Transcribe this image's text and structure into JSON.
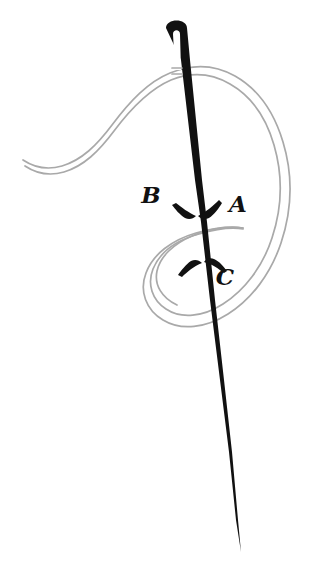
{
  "figure": {
    "background_color": "#ffffff",
    "width": 321,
    "height": 566
  },
  "objects": {
    "needle": {
      "name": "sewing-needle",
      "color": "#111111",
      "eye_color": "#ffffff",
      "description": "Long tapered black needle angled slightly right, with an elongated slot eye near the top and a sharp point at the bottom."
    },
    "thread": {
      "name": "thread",
      "color": "#a9a9a9",
      "stroke_width": 1.6,
      "description": "Light gray double-outline thread entering from the left, passing through the needle eye, curving right and coiling into a spiral loop below the needle entry point."
    }
  },
  "labels": [
    {
      "id": "A",
      "text": "A",
      "x": 238,
      "y": 212,
      "meaning": "point where needle goes down through the fabric"
    },
    {
      "id": "B",
      "text": "B",
      "x": 151,
      "y": 203,
      "meaning": "label for the downward motion of the needle"
    },
    {
      "id": "C",
      "text": "C",
      "x": 225,
      "y": 285,
      "meaning": "point where needle comes back up through the fabric"
    }
  ],
  "arrows": [
    {
      "id": "down-arrow",
      "direction": "down",
      "near_label": "B",
      "color": "#111111",
      "x": 197,
      "y": 212
    },
    {
      "id": "up-arrow",
      "direction": "up",
      "near_label": "C",
      "color": "#111111",
      "x": 204,
      "y": 265
    }
  ]
}
